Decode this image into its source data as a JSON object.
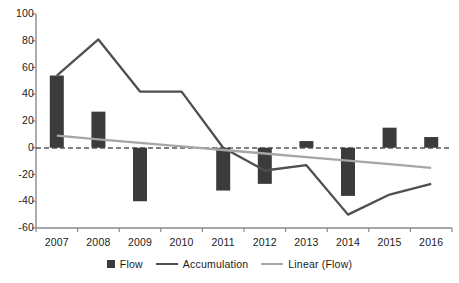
{
  "chart_data": {
    "type": "bar",
    "title": "",
    "subtitle": "",
    "xlabel": "",
    "ylabel": "",
    "categories": [
      "2007",
      "2008",
      "2009",
      "2010",
      "2011",
      "2012",
      "2013",
      "2014",
      "2015",
      "2016"
    ],
    "ylim": [
      -60,
      100
    ],
    "yticks": [
      100,
      80,
      60,
      40,
      20,
      0,
      -20,
      -40,
      -60
    ],
    "ytick_labels": [
      "100",
      "80",
      "60",
      "40",
      "20",
      "0",
      "-20",
      "-40",
      "-60"
    ],
    "grid": false,
    "zero_line": true,
    "zero_line_style": "dashed",
    "legend_position": "bottom",
    "series": [
      {
        "name": "Flow",
        "type": "bar",
        "color": "#3b3b3b",
        "values": [
          54,
          27,
          -40,
          0,
          -32,
          -27,
          5,
          -36,
          15,
          8
        ]
      },
      {
        "name": "Accumulation",
        "type": "line",
        "color": "#4f4f4f",
        "values": [
          54,
          81,
          42,
          42,
          0,
          -17,
          -13,
          -50,
          -35,
          -27
        ]
      },
      {
        "name": "Linear (Flow)",
        "type": "line",
        "color": "#a6a6a6",
        "values": [
          9,
          6.3,
          3.7,
          1,
          -1.7,
          -4.3,
          -7,
          -9.7,
          -12.3,
          -15
        ]
      }
    ]
  },
  "axis": {
    "y_axis_color": "#808080",
    "x_axis_color": "#808080",
    "zero_line_color": "#555555"
  },
  "legend": {
    "items": [
      {
        "label": "Flow",
        "marker": "square",
        "color": "#3b3b3b"
      },
      {
        "label": "Accumulation",
        "marker": "line",
        "color": "#4f4f4f"
      },
      {
        "label": "Linear (Flow)",
        "marker": "line",
        "color": "#a6a6a6"
      }
    ]
  }
}
